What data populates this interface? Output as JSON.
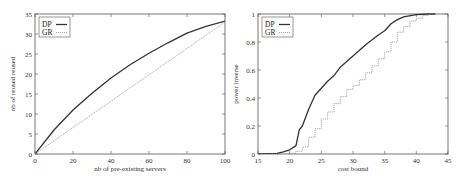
{
  "chart_data": [
    {
      "type": "line",
      "title": "",
      "xlabel": "nb of pre-existing servers",
      "ylabel": "nb of reused reused",
      "xlim": [
        0,
        100
      ],
      "ylim": [
        0,
        35
      ],
      "xticks": [
        0,
        20,
        40,
        60,
        80,
        100
      ],
      "yticks": [
        0,
        5,
        10,
        15,
        20,
        25,
        30,
        35
      ],
      "grid": false,
      "legend_position": "upper left",
      "series": [
        {
          "name": "DP",
          "style": "solid-thick",
          "x": [
            0,
            10,
            20,
            30,
            40,
            50,
            60,
            70,
            80,
            90,
            100
          ],
          "values": [
            0,
            6.0,
            11.0,
            15.2,
            19.0,
            22.3,
            25.2,
            27.8,
            30.2,
            31.9,
            33.2
          ]
        },
        {
          "name": "GR",
          "style": "dotted",
          "x": [
            0,
            100
          ],
          "values": [
            0,
            33.0
          ]
        }
      ]
    },
    {
      "type": "line",
      "title": "",
      "xlabel": "cost bound",
      "ylabel": "power inverse",
      "xlim": [
        15,
        45
      ],
      "ylim": [
        0,
        1
      ],
      "xticks": [
        15,
        20,
        25,
        30,
        35,
        40,
        45
      ],
      "yticks": [
        0,
        0.2,
        0.4,
        0.6,
        0.8,
        1
      ],
      "ytick_labels": [
        "0",
        "0.2",
        "0.4",
        "0.6",
        "0.8",
        "1"
      ],
      "grid": false,
      "legend_position": "upper left",
      "series": [
        {
          "name": "DP",
          "style": "solid-thick",
          "x": [
            15,
            18,
            19,
            20,
            21,
            21.5,
            22,
            23,
            24,
            25,
            26,
            27,
            28,
            29,
            30,
            32,
            34,
            35,
            36,
            37,
            38,
            40,
            42,
            43
          ],
          "values": [
            0,
            0.005,
            0.015,
            0.03,
            0.06,
            0.17,
            0.2,
            0.32,
            0.42,
            0.47,
            0.52,
            0.56,
            0.62,
            0.66,
            0.7,
            0.78,
            0.85,
            0.88,
            0.93,
            0.96,
            0.98,
            0.995,
            1,
            1
          ]
        },
        {
          "name": "GR",
          "style": "dotted-step",
          "x": [
            15,
            20,
            21,
            22,
            23,
            24,
            25,
            26,
            27,
            28,
            29,
            30,
            31,
            32,
            33,
            34,
            35,
            36,
            37,
            38,
            39,
            40,
            41,
            42,
            43
          ],
          "values": [
            0,
            0.005,
            0.02,
            0.05,
            0.12,
            0.18,
            0.25,
            0.3,
            0.36,
            0.41,
            0.46,
            0.49,
            0.53,
            0.58,
            0.63,
            0.68,
            0.73,
            0.8,
            0.87,
            0.91,
            0.95,
            0.97,
            0.99,
            1,
            1
          ]
        }
      ]
    }
  ],
  "colors": {
    "dp_line": "#333333",
    "gr_line": "#888888",
    "frame": "#555555"
  }
}
